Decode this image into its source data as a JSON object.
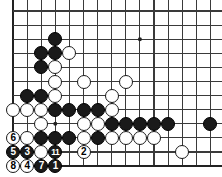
{
  "diagram": {
    "type": "go-board-problem-diagram",
    "board_size_visible": {
      "cols": 15,
      "rows": 11
    },
    "edges": {
      "left": true,
      "bottom": true,
      "top": false,
      "right": false
    },
    "colors": {
      "line": "#3a3a3a",
      "edge_line": "#222222",
      "black_stone": "#1a1a1a",
      "white_stone": "#ffffff",
      "white_stone_border": "#1a1a1a",
      "background": "#ffffff",
      "label_on_black": "#ffffff",
      "label_on_white": "#000000"
    },
    "geometry": {
      "origin_x": 13,
      "origin_y": 11,
      "spacing": 14.1,
      "stone_diameter": 14,
      "hoshi_radius": 2
    },
    "star_points": [
      {
        "col": 3,
        "row": 2
      },
      {
        "col": 9,
        "row": 2
      },
      {
        "col": 3,
        "row": 8
      }
    ],
    "stones": [
      {
        "col": 3,
        "row": 2,
        "color": "black",
        "label": ""
      },
      {
        "col": 2,
        "row": 3,
        "color": "black",
        "label": ""
      },
      {
        "col": 3,
        "row": 3,
        "color": "black",
        "label": ""
      },
      {
        "col": 4,
        "row": 3,
        "color": "white",
        "label": ""
      },
      {
        "col": 3,
        "row": 4,
        "color": "white",
        "label": ""
      },
      {
        "col": 2,
        "row": 4,
        "color": "black",
        "label": ""
      },
      {
        "col": 3,
        "row": 5,
        "color": "white",
        "label": ""
      },
      {
        "col": 5,
        "row": 5,
        "color": "white",
        "label": ""
      },
      {
        "col": 8,
        "row": 5,
        "color": "white",
        "label": ""
      },
      {
        "col": 1,
        "row": 6,
        "color": "black",
        "label": ""
      },
      {
        "col": 2,
        "row": 6,
        "color": "black",
        "label": ""
      },
      {
        "col": 3,
        "row": 6,
        "color": "white",
        "label": ""
      },
      {
        "col": 7,
        "row": 6,
        "color": "white",
        "label": ""
      },
      {
        "col": 0,
        "row": 7,
        "color": "white",
        "label": ""
      },
      {
        "col": 1,
        "row": 7,
        "color": "white",
        "label": ""
      },
      {
        "col": 2,
        "row": 7,
        "color": "white",
        "label": ""
      },
      {
        "col": 3,
        "row": 7,
        "color": "black",
        "label": ""
      },
      {
        "col": 4,
        "row": 7,
        "color": "black",
        "label": ""
      },
      {
        "col": 5,
        "row": 7,
        "color": "black",
        "label": ""
      },
      {
        "col": 6,
        "row": 7,
        "color": "black",
        "label": ""
      },
      {
        "col": 7,
        "row": 7,
        "color": "white",
        "label": ""
      },
      {
        "col": 2,
        "row": 8,
        "color": "white",
        "label": ""
      },
      {
        "col": 5,
        "row": 8,
        "color": "white",
        "label": ""
      },
      {
        "col": 6,
        "row": 8,
        "color": "white",
        "label": ""
      },
      {
        "col": 7,
        "row": 8,
        "color": "black",
        "label": ""
      },
      {
        "col": 8,
        "row": 8,
        "color": "black",
        "label": ""
      },
      {
        "col": 9,
        "row": 8,
        "color": "black",
        "label": ""
      },
      {
        "col": 10,
        "row": 8,
        "color": "black",
        "label": ""
      },
      {
        "col": 11,
        "row": 8,
        "color": "black",
        "label": ""
      },
      {
        "col": 14,
        "row": 8,
        "color": "black",
        "label": ""
      },
      {
        "col": 0,
        "row": 9,
        "color": "white",
        "label": "6"
      },
      {
        "col": 1,
        "row": 9,
        "color": "white",
        "label": ""
      },
      {
        "col": 2,
        "row": 9,
        "color": "black",
        "label": ""
      },
      {
        "col": 3,
        "row": 9,
        "color": "black",
        "label": ""
      },
      {
        "col": 4,
        "row": 9,
        "color": "black",
        "label": ""
      },
      {
        "col": 5,
        "row": 9,
        "color": "white",
        "label": ""
      },
      {
        "col": 6,
        "row": 9,
        "color": "black",
        "label": ""
      },
      {
        "col": 7,
        "row": 9,
        "color": "white",
        "label": ""
      },
      {
        "col": 8,
        "row": 9,
        "color": "white",
        "label": ""
      },
      {
        "col": 9,
        "row": 9,
        "color": "white",
        "label": ""
      },
      {
        "col": 10,
        "row": 9,
        "color": "white",
        "label": ""
      },
      {
        "col": 0,
        "row": 10,
        "color": "black",
        "label": "5"
      },
      {
        "col": 1,
        "row": 10,
        "color": "black",
        "label": "3"
      },
      {
        "col": 2,
        "row": 10,
        "color": "white",
        "label": ""
      },
      {
        "col": 3,
        "row": 10,
        "color": "black",
        "label": "11"
      },
      {
        "col": 5,
        "row": 10,
        "color": "white",
        "label": "2"
      },
      {
        "col": 12,
        "row": 10,
        "color": "white",
        "label": ""
      },
      {
        "col": 0,
        "row": 11,
        "color": "white",
        "label": "8"
      },
      {
        "col": 1,
        "row": 11,
        "color": "white",
        "label": "4"
      },
      {
        "col": 2,
        "row": 11,
        "color": "black",
        "label": "7"
      },
      {
        "col": 3,
        "row": 11,
        "color": "black",
        "label": "1"
      }
    ],
    "move_numbers": [
      "1",
      "2",
      "3",
      "4",
      "5",
      "6",
      "7",
      "8",
      "11"
    ]
  }
}
